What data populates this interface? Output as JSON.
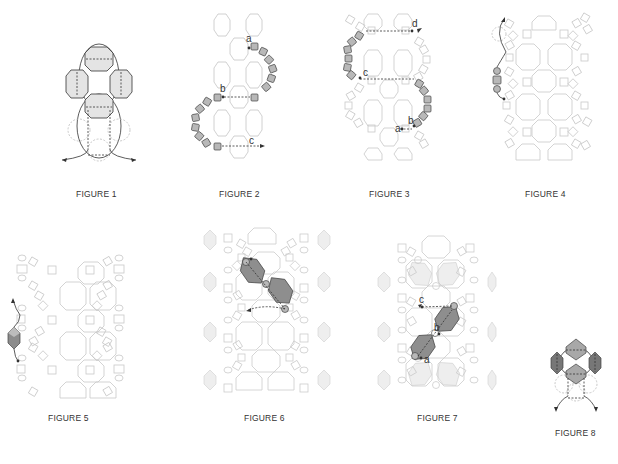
{
  "page": {
    "background": "#ffffff"
  },
  "figures": [
    {
      "id": 1,
      "caption": "FIGURE 1",
      "labels": []
    },
    {
      "id": 2,
      "caption": "FIGURE 2",
      "labels": [
        "a",
        "b",
        "c"
      ]
    },
    {
      "id": 3,
      "caption": "FIGURE 3",
      "labels": [
        "a",
        "b",
        "c",
        "d"
      ]
    },
    {
      "id": 4,
      "caption": "FIGURE 4",
      "labels": []
    },
    {
      "id": 5,
      "caption": "FIGURE 5",
      "labels": []
    },
    {
      "id": 6,
      "caption": "FIGURE 6",
      "labels": []
    },
    {
      "id": 7,
      "caption": "FIGURE 7",
      "labels": [
        "a",
        "b",
        "c"
      ]
    },
    {
      "id": 8,
      "caption": "FIGURE 8",
      "labels": []
    }
  ],
  "colors": {
    "outline": "#333333",
    "faded": "#c8c8c8",
    "bead_fill": "#b5b5b5",
    "bicone_dark": "#8a8a8a",
    "bicone_light": "#e6e6e6",
    "caption": "#333333"
  }
}
